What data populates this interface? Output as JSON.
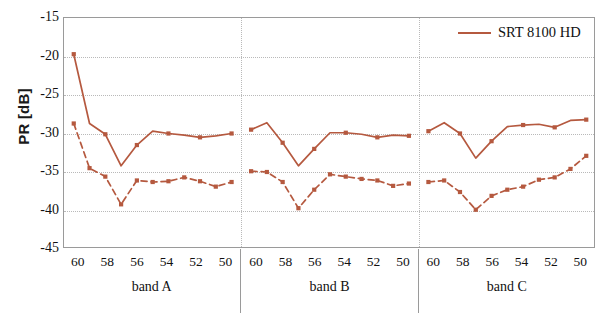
{
  "chart_data": {
    "type": "line",
    "title": "",
    "xlabel": "",
    "ylabel": "PR [dB]",
    "ylim": [
      -45,
      -15
    ],
    "yticks": [
      -15,
      -20,
      -25,
      -30,
      -35,
      -40,
      -45
    ],
    "ytick_labels": [
      "-15",
      "-20",
      "-25",
      "-30",
      "-35",
      "-40",
      "-45"
    ],
    "grid": true,
    "legend_position": "top-right",
    "legend": [
      "SRT 8100 HD"
    ],
    "x_groups": [
      {
        "name": "band A",
        "ticks": [
          "60",
          "58",
          "56",
          "54",
          "52",
          "50"
        ]
      },
      {
        "name": "band B",
        "ticks": [
          "60",
          "58",
          "56",
          "54",
          "52",
          "50"
        ]
      },
      {
        "name": "band C",
        "ticks": [
          "60",
          "58",
          "56",
          "54",
          "52",
          "50"
        ]
      }
    ],
    "categories": [
      60,
      58,
      56,
      54,
      52,
      50
    ],
    "series": [
      {
        "name": "SRT 8100 HD",
        "style": "solid",
        "color": "#b5593f",
        "groups": [
          {
            "group": "band A",
            "x": [
              60,
              59,
              58,
              57,
              56,
              55,
              54,
              53,
              52,
              51,
              50
            ],
            "values": [
              -19.7,
              -28.7,
              -30.1,
              -34.2,
              -31.5,
              -29.7,
              -30.0,
              -30.2,
              -30.5,
              -30.3,
              -30.0
            ]
          },
          {
            "group": "band B",
            "x": [
              60,
              59,
              58,
              57,
              56,
              55,
              54,
              53,
              52,
              51,
              50
            ],
            "values": [
              -29.5,
              -28.6,
              -31.2,
              -34.2,
              -32.0,
              -29.9,
              -29.9,
              -30.1,
              -30.5,
              -30.2,
              -30.3
            ]
          },
          {
            "group": "band C",
            "x": [
              60,
              59,
              58,
              57,
              56,
              55,
              54,
              53,
              52,
              51,
              50
            ],
            "values": [
              -29.7,
              -28.6,
              -30.0,
              -33.2,
              -31.0,
              -29.1,
              -28.9,
              -28.8,
              -29.2,
              -28.3,
              -28.2
            ]
          }
        ]
      },
      {
        "name": "SRT 8100 HD (dashed)",
        "style": "dashed",
        "color": "#b5593f",
        "groups": [
          {
            "group": "band A",
            "x": [
              60,
              59,
              58,
              57,
              56,
              55,
              54,
              53,
              52,
              51,
              50
            ],
            "values": [
              -28.7,
              -34.5,
              -35.6,
              -39.2,
              -36.1,
              -36.3,
              -36.2,
              -35.7,
              -36.2,
              -36.9,
              -36.3
            ]
          },
          {
            "group": "band B",
            "x": [
              60,
              59,
              58,
              57,
              56,
              55,
              54,
              53,
              52,
              51,
              50
            ],
            "values": [
              -34.9,
              -35.0,
              -36.3,
              -39.7,
              -37.3,
              -35.3,
              -35.6,
              -35.9,
              -36.1,
              -36.8,
              -36.5
            ]
          },
          {
            "group": "band C",
            "x": [
              60,
              59,
              58,
              57,
              56,
              55,
              54,
              53,
              52,
              51,
              50
            ],
            "values": [
              -36.3,
              -36.1,
              -37.6,
              -39.9,
              -38.1,
              -37.3,
              -36.9,
              -36.0,
              -35.7,
              -34.6,
              -32.9
            ]
          }
        ]
      }
    ]
  },
  "legend": {
    "entry_label": "SRT 8100 HD"
  },
  "axes": {
    "y_title": "PR [dB]"
  }
}
